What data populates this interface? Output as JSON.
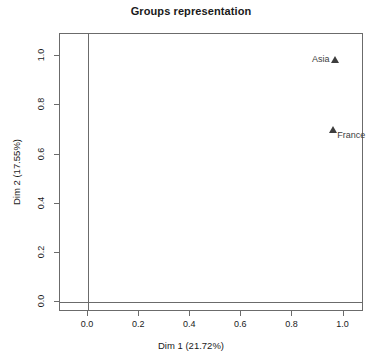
{
  "chart_data": {
    "type": "scatter",
    "title": "Groups representation",
    "xlabel": "Dim 1 (21.72%)",
    "ylabel": "Dim 2 (17.55%)",
    "xlim": [
      -0.11,
      1.08
    ],
    "ylim": [
      -0.04,
      1.09
    ],
    "xticks": [
      "0.0",
      "0.2",
      "0.4",
      "0.6",
      "0.8",
      "1.0"
    ],
    "xtick_values": [
      0.0,
      0.2,
      0.4,
      0.6,
      0.8,
      1.0
    ],
    "yticks": [
      "0.0",
      "0.2",
      "0.4",
      "0.6",
      "0.8",
      "1.0"
    ],
    "ytick_values": [
      0.0,
      0.2,
      0.4,
      0.6,
      0.8,
      1.0
    ],
    "grid": false,
    "legend": "none",
    "reference_lines": {
      "vertical_x": 0.0,
      "horizontal_y": 0.0
    },
    "marker": "triangle",
    "marker_color": "#3d3d3d",
    "points": [
      {
        "label": "Asia",
        "x": 0.965,
        "y": 0.985,
        "label_side": "left"
      },
      {
        "label": "France",
        "x": 0.96,
        "y": 0.7,
        "label_side": "right"
      }
    ]
  },
  "colors": {
    "axis": "#6b6b6b",
    "text": "#1a1a1a",
    "marker": "#3d3d3d",
    "background": "#ffffff"
  }
}
